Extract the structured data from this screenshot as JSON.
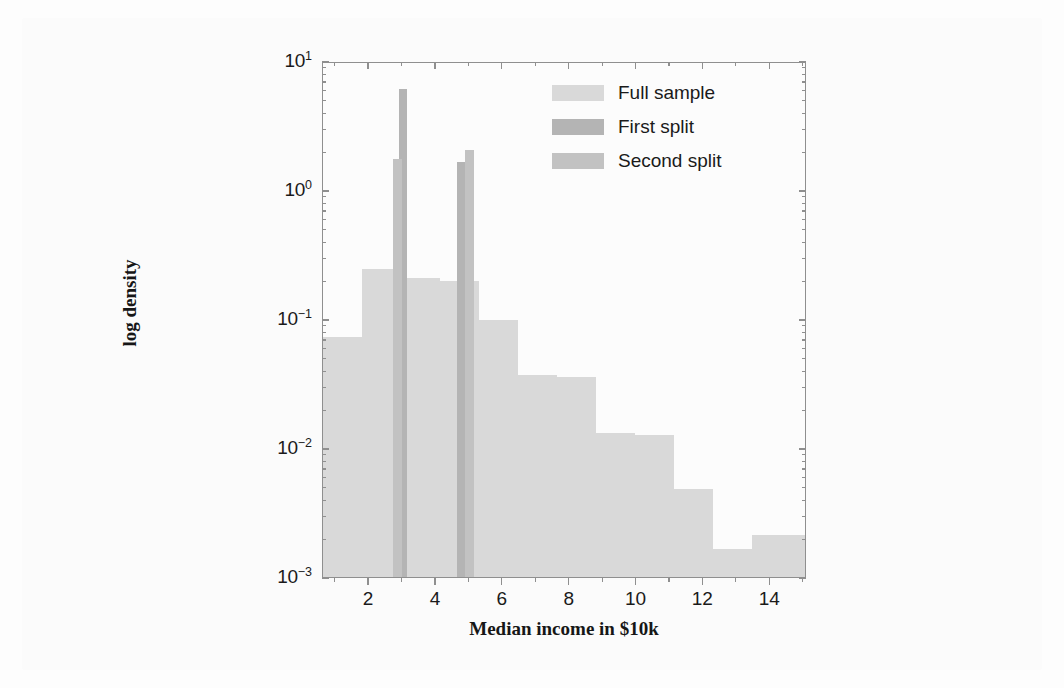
{
  "figure": {
    "background_color": "#fbfbfb",
    "axes_color": "#8f8f8f"
  },
  "legend": {
    "items": [
      {
        "label": "Full sample",
        "color": "#d9d9d9"
      },
      {
        "label": "First split",
        "color": "#b4b4b4"
      },
      {
        "label": "Second split",
        "color": "#c2c2c2"
      }
    ]
  },
  "chart_data": {
    "type": "bar",
    "title": "",
    "xlabel": "Median income in $10k",
    "ylabel": "log density",
    "xlim": [
      0.62,
      15.1
    ],
    "ylim": [
      0.001,
      10
    ],
    "yscale": "log",
    "grid": false,
    "legend_position": "upper right",
    "xticks": [
      2,
      4,
      6,
      8,
      10,
      12,
      14
    ],
    "xtick_labels": [
      "2",
      "4",
      "6",
      "8",
      "10",
      "12",
      "14"
    ],
    "yticks": [
      10,
      1,
      0.1,
      0.01,
      0.001
    ],
    "ytick_labels": [
      "10¹",
      "10⁰",
      "10⁻¹",
      "10⁻²",
      "10⁻³"
    ],
    "ytick_mantissas": [
      "10",
      "10",
      "10",
      "10",
      "10"
    ],
    "ytick_exponents": [
      "1",
      "0",
      "-1",
      "-2",
      "-3"
    ],
    "series": [
      {
        "name": "Full sample",
        "color": "#d9d9d9",
        "type": "histogram",
        "bins": [
          {
            "x0": 0.62,
            "x1": 1.8,
            "value": 0.075
          },
          {
            "x0": 1.8,
            "x1": 2.95,
            "value": 0.255
          },
          {
            "x0": 2.95,
            "x1": 4.12,
            "value": 0.215
          },
          {
            "x0": 4.12,
            "x1": 5.28,
            "value": 0.205
          },
          {
            "x0": 5.28,
            "x1": 6.45,
            "value": 0.102
          },
          {
            "x0": 6.45,
            "x1": 7.62,
            "value": 0.038
          },
          {
            "x0": 7.62,
            "x1": 8.78,
            "value": 0.037
          },
          {
            "x0": 8.78,
            "x1": 9.95,
            "value": 0.0135
          },
          {
            "x0": 9.95,
            "x1": 11.12,
            "value": 0.013
          },
          {
            "x0": 11.12,
            "x1": 12.28,
            "value": 0.005
          },
          {
            "x0": 12.28,
            "x1": 13.45,
            "value": 0.0017
          },
          {
            "x0": 13.45,
            "x1": 15.1,
            "value": 0.0022
          }
        ]
      },
      {
        "name": "First split",
        "color": "#b4b4b4",
        "type": "histogram",
        "bins": [
          {
            "x0": 2.88,
            "x1": 3.12,
            "value": 6.3
          },
          {
            "x0": 4.62,
            "x1": 4.9,
            "value": 1.7
          }
        ]
      },
      {
        "name": "Second split",
        "color": "#c2c2c2",
        "type": "histogram",
        "bins": [
          {
            "x0": 2.72,
            "x1": 2.98,
            "value": 1.8
          },
          {
            "x0": 4.88,
            "x1": 5.14,
            "value": 2.1
          }
        ]
      }
    ]
  }
}
